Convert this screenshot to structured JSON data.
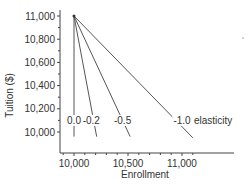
{
  "chart_data": {
    "type": "line",
    "title": "",
    "xlabel": "Enrollment",
    "ylabel": "Tuition ($)",
    "xlim": [
      9870,
      11170
    ],
    "ylim": [
      9930,
      11030
    ],
    "x_ticks": [
      10000,
      10500,
      11000
    ],
    "x_tick_labels": [
      "10,000",
      "10,500",
      "11,000"
    ],
    "y_ticks": [
      10000,
      10200,
      10400,
      10600,
      10800,
      11000
    ],
    "y_tick_labels": [
      "10,000",
      "10,200",
      "10,400",
      "10,600",
      "10,800",
      "11,000"
    ],
    "grid": false,
    "legend": "none",
    "series": [
      {
        "name": "0.0",
        "x": [
          10000,
          10000
        ],
        "y": [
          11000,
          9960
        ]
      },
      {
        "name": "-0.2",
        "x": [
          10000,
          10210
        ],
        "y": [
          11000,
          9960
        ]
      },
      {
        "name": "-0.5",
        "x": [
          10000,
          10520
        ],
        "y": [
          11000,
          9960
        ]
      },
      {
        "name": "-1.0",
        "x": [
          10000,
          11100
        ],
        "y": [
          11000,
          9950
        ]
      }
    ],
    "annotations": [
      {
        "text": "0.0",
        "x": 10000,
        "y": 10100
      },
      {
        "text": "-0.2",
        "x": 10160,
        "y": 10100
      },
      {
        "text": "-0.5",
        "x": 10450,
        "y": 10100
      },
      {
        "text": "-1.0",
        "x": 11000,
        "y": 10100
      },
      {
        "text": "elasticity",
        "x": 11110,
        "y": 10100
      }
    ],
    "colors": {
      "line": "#555555",
      "axis": "#444444",
      "text": "#333333"
    }
  }
}
